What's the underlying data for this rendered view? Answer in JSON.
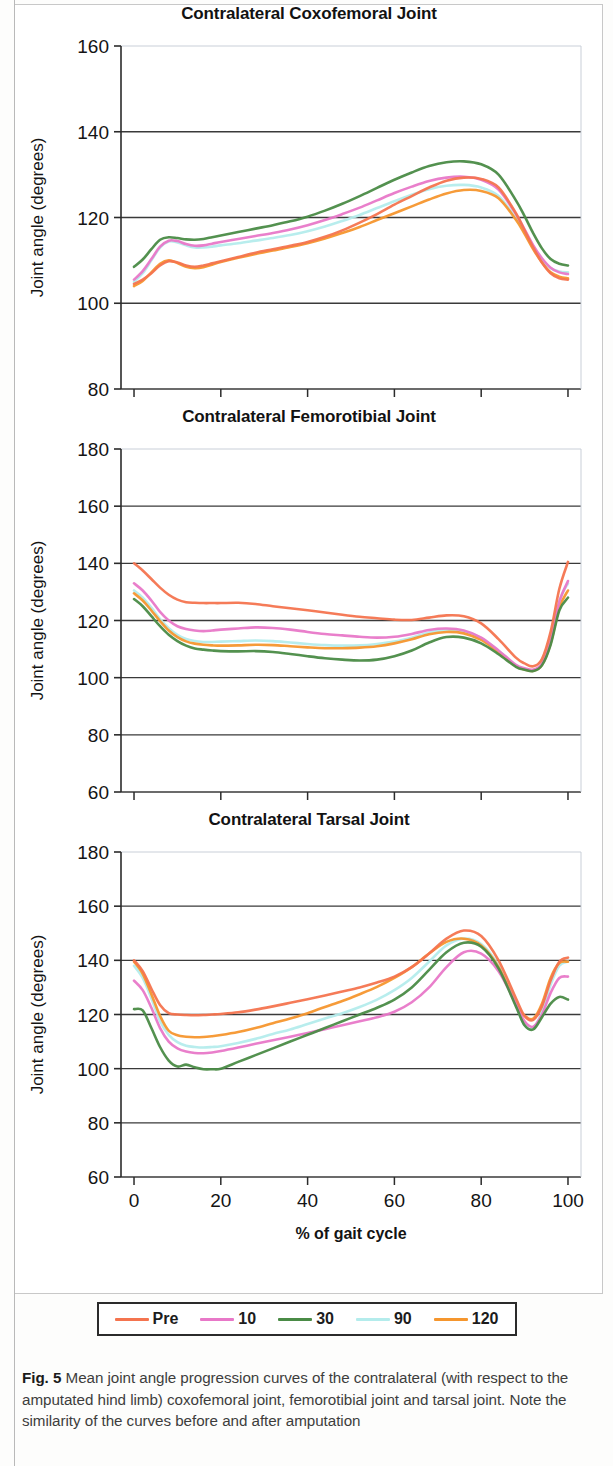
{
  "figure": {
    "label": "Fig. 5",
    "caption": "Mean joint angle progression curves of the contralateral (with respect to the amputated hind limb) coxofemoral joint, femorotibial joint and tarsal joint. Note the similarity of the curves before and after amputation"
  },
  "legend": {
    "position": "bottom",
    "items": [
      {
        "label": "Pre",
        "color": "#f4744f"
      },
      {
        "label": "10",
        "color": "#e878c8"
      },
      {
        "label": "30",
        "color": "#4a8b46"
      },
      {
        "label": "90",
        "color": "#b4ecec"
      },
      {
        "label": "120",
        "color": "#f5962e"
      }
    ]
  },
  "axes": {
    "ylabel": "Joint angle (degrees)",
    "xlabel": "% of gait cycle",
    "xticks": [
      0,
      20,
      40,
      60,
      80,
      100
    ],
    "xlim": [
      -3,
      103
    ]
  },
  "chart_data": [
    {
      "type": "line",
      "title": "Contralateral Coxofemoral Joint",
      "xlabel": "",
      "ylabel": "Joint angle (degrees)",
      "xlim": [
        -3,
        103
      ],
      "ylim": [
        80,
        160
      ],
      "yticks": [
        80,
        100,
        120,
        140,
        160
      ],
      "xticks": [
        0,
        20,
        40,
        60,
        80,
        100
      ],
      "grid": true,
      "x": [
        0,
        2,
        4,
        6,
        8,
        10,
        12,
        14,
        16,
        18,
        20,
        24,
        28,
        32,
        36,
        40,
        44,
        48,
        52,
        56,
        60,
        64,
        68,
        72,
        76,
        80,
        84,
        88,
        90,
        92,
        94,
        96,
        98,
        100
      ],
      "series": [
        {
          "name": "Pre",
          "values": [
            104.5,
            105.5,
            107.0,
            108.8,
            109.8,
            109.5,
            108.8,
            108.5,
            108.8,
            109.3,
            109.8,
            110.8,
            111.8,
            112.6,
            113.4,
            114.3,
            115.5,
            117.0,
            118.8,
            120.8,
            123.0,
            125.0,
            127.0,
            128.6,
            129.3,
            129.0,
            127.0,
            121.0,
            117.0,
            113.0,
            109.5,
            107.0,
            105.8,
            105.5
          ]
        },
        {
          "name": "10",
          "values": [
            105.5,
            107.5,
            110.3,
            113.2,
            114.6,
            114.5,
            113.8,
            113.4,
            113.5,
            113.9,
            114.3,
            115.0,
            115.7,
            116.4,
            117.2,
            118.2,
            119.4,
            120.8,
            122.3,
            124.0,
            125.7,
            127.2,
            128.5,
            129.3,
            129.5,
            128.8,
            126.5,
            120.8,
            117.2,
            113.5,
            110.5,
            108.3,
            107.2,
            106.8
          ]
        },
        {
          "name": "30",
          "values": [
            108.5,
            110.2,
            112.6,
            114.8,
            115.4,
            115.2,
            114.9,
            114.8,
            115.0,
            115.4,
            115.8,
            116.6,
            117.4,
            118.2,
            119.1,
            120.2,
            121.6,
            123.2,
            125.0,
            126.9,
            128.8,
            130.5,
            132.0,
            132.9,
            133.1,
            132.4,
            130.0,
            124.0,
            120.3,
            116.3,
            112.8,
            110.3,
            109.2,
            108.8
          ]
        },
        {
          "name": "90",
          "values": [
            105.0,
            107.0,
            110.0,
            113.0,
            114.4,
            114.2,
            113.5,
            113.0,
            113.0,
            113.2,
            113.5,
            114.0,
            114.6,
            115.2,
            115.9,
            116.8,
            117.9,
            119.2,
            120.6,
            122.2,
            123.8,
            125.3,
            126.6,
            127.4,
            127.6,
            127.0,
            125.0,
            119.8,
            116.5,
            113.0,
            110.2,
            108.2,
            107.4,
            107.2
          ]
        },
        {
          "name": "120",
          "values": [
            104.0,
            105.2,
            107.2,
            109.2,
            110.0,
            109.4,
            108.5,
            108.2,
            108.4,
            109.0,
            109.6,
            110.6,
            111.5,
            112.3,
            113.1,
            114.0,
            115.1,
            116.4,
            117.8,
            119.4,
            121.0,
            122.6,
            124.2,
            125.6,
            126.4,
            126.2,
            124.5,
            119.5,
            116.2,
            112.6,
            109.5,
            107.2,
            106.2,
            105.8
          ]
        }
      ]
    },
    {
      "type": "line",
      "title": "Contralateral Femorotibial Joint",
      "xlabel": "",
      "ylabel": "Joint angle (degrees)",
      "xlim": [
        -3,
        103
      ],
      "ylim": [
        60,
        180
      ],
      "yticks": [
        60,
        80,
        100,
        120,
        140,
        160,
        180
      ],
      "xticks": [
        0,
        20,
        40,
        60,
        80,
        100
      ],
      "grid": true,
      "x": [
        0,
        2,
        4,
        6,
        8,
        10,
        12,
        14,
        16,
        18,
        20,
        24,
        28,
        32,
        36,
        40,
        44,
        48,
        52,
        56,
        60,
        64,
        68,
        72,
        76,
        80,
        84,
        88,
        90,
        92,
        94,
        96,
        98,
        100
      ],
      "series": [
        {
          "name": "Pre",
          "values": [
            140.0,
            137.5,
            134.5,
            131.5,
            129.0,
            127.3,
            126.4,
            126.2,
            126.1,
            126.1,
            126.1,
            126.2,
            125.8,
            125.0,
            124.3,
            123.6,
            122.8,
            122.0,
            121.3,
            120.8,
            120.3,
            120.2,
            121.0,
            121.8,
            121.5,
            119.0,
            113.5,
            107.0,
            105.0,
            104.0,
            106.5,
            116.0,
            131.0,
            140.5
          ]
        },
        {
          "name": "10",
          "values": [
            133.0,
            130.5,
            127.0,
            123.0,
            120.0,
            118.0,
            117.0,
            116.5,
            116.3,
            116.5,
            116.8,
            117.2,
            117.6,
            117.4,
            116.8,
            116.0,
            115.3,
            114.8,
            114.3,
            114.0,
            114.3,
            115.3,
            116.7,
            117.2,
            116.5,
            114.0,
            109.5,
            104.5,
            103.3,
            102.8,
            105.0,
            113.0,
            126.5,
            133.8
          ]
        },
        {
          "name": "30",
          "values": [
            127.5,
            125.0,
            121.5,
            118.0,
            115.0,
            112.8,
            111.2,
            110.2,
            109.8,
            109.5,
            109.3,
            109.2,
            109.3,
            109.0,
            108.3,
            107.5,
            106.8,
            106.3,
            106.0,
            106.3,
            107.5,
            109.5,
            112.3,
            114.2,
            114.0,
            112.0,
            108.2,
            103.8,
            102.8,
            102.3,
            104.3,
            111.5,
            123.5,
            128.0
          ]
        },
        {
          "name": "90",
          "values": [
            130.5,
            128.0,
            124.5,
            120.5,
            117.3,
            115.0,
            113.5,
            112.8,
            112.5,
            112.5,
            112.6,
            112.8,
            113.0,
            112.8,
            112.3,
            111.8,
            111.4,
            111.2,
            111.3,
            111.8,
            112.6,
            114.0,
            115.8,
            116.7,
            116.2,
            113.8,
            109.3,
            104.2,
            103.0,
            102.5,
            104.8,
            112.8,
            126.8,
            133.0
          ]
        },
        {
          "name": "120",
          "values": [
            129.5,
            127.0,
            123.5,
            119.8,
            116.5,
            114.2,
            112.7,
            111.9,
            111.5,
            111.3,
            111.2,
            111.3,
            111.5,
            111.4,
            111.0,
            110.6,
            110.3,
            110.3,
            110.5,
            111.0,
            112.0,
            113.4,
            115.2,
            116.0,
            115.5,
            113.2,
            108.9,
            104.0,
            102.9,
            102.4,
            104.5,
            112.0,
            124.5,
            130.5
          ]
        }
      ]
    },
    {
      "type": "line",
      "title": "Contralateral Tarsal Joint",
      "xlabel": "% of gait cycle",
      "ylabel": "Joint angle (degrees)",
      "xlim": [
        -3,
        103
      ],
      "ylim": [
        60,
        180
      ],
      "yticks": [
        60,
        80,
        100,
        120,
        140,
        160,
        180
      ],
      "xticks": [
        0,
        20,
        40,
        60,
        80,
        100
      ],
      "grid": true,
      "x": [
        0,
        2,
        4,
        6,
        8,
        10,
        12,
        14,
        16,
        18,
        20,
        24,
        28,
        32,
        36,
        40,
        44,
        48,
        52,
        56,
        60,
        64,
        68,
        72,
        76,
        80,
        84,
        88,
        90,
        92,
        94,
        96,
        98,
        100
      ],
      "series": [
        {
          "name": "Pre",
          "values": [
            140.0,
            136.0,
            129.5,
            123.5,
            120.5,
            120.0,
            119.8,
            119.7,
            119.8,
            120.0,
            120.2,
            120.8,
            121.8,
            123.0,
            124.3,
            125.6,
            127.0,
            128.5,
            130.0,
            131.8,
            134.0,
            137.5,
            142.5,
            148.0,
            151.0,
            149.0,
            140.0,
            126.0,
            119.5,
            118.0,
            123.0,
            132.5,
            139.5,
            141.0
          ]
        },
        {
          "name": "10",
          "values": [
            132.5,
            129.0,
            122.5,
            115.0,
            110.0,
            107.5,
            106.3,
            105.8,
            105.7,
            106.0,
            106.5,
            107.8,
            109.2,
            110.5,
            111.8,
            113.2,
            114.6,
            116.0,
            117.5,
            119.0,
            121.0,
            124.5,
            130.0,
            137.5,
            143.0,
            142.5,
            136.0,
            124.0,
            117.5,
            115.5,
            120.0,
            128.0,
            133.5,
            134.0
          ]
        },
        {
          "name": "30",
          "values": [
            122.0,
            121.5,
            115.0,
            108.0,
            103.0,
            100.8,
            101.5,
            100.5,
            99.8,
            99.8,
            100.0,
            102.5,
            105.0,
            107.5,
            110.0,
            112.5,
            115.0,
            117.5,
            120.0,
            122.5,
            125.5,
            130.0,
            136.5,
            143.0,
            146.5,
            145.0,
            137.0,
            123.0,
            116.0,
            114.5,
            119.0,
            124.0,
            126.5,
            125.5
          ]
        },
        {
          "name": "90",
          "values": [
            138.0,
            133.5,
            126.0,
            117.5,
            112.5,
            109.8,
            108.5,
            108.0,
            107.8,
            108.0,
            108.3,
            109.5,
            111.0,
            112.8,
            114.5,
            116.5,
            118.5,
            120.5,
            122.8,
            125.5,
            129.0,
            133.5,
            139.5,
            145.5,
            148.0,
            146.0,
            138.0,
            123.5,
            116.0,
            115.0,
            121.0,
            131.0,
            138.0,
            139.5
          ]
        },
        {
          "name": "120",
          "values": [
            139.5,
            135.0,
            127.5,
            119.5,
            114.0,
            112.3,
            111.8,
            111.6,
            111.7,
            112.0,
            112.4,
            113.5,
            115.0,
            116.8,
            118.5,
            120.5,
            122.8,
            125.0,
            127.5,
            130.2,
            133.5,
            137.5,
            142.5,
            146.8,
            148.0,
            145.5,
            137.5,
            124.0,
            119.5,
            118.5,
            124.0,
            133.5,
            139.0,
            139.5
          ]
        }
      ]
    }
  ]
}
